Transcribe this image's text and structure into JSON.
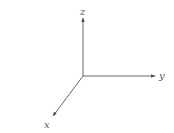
{
  "diagram": {
    "title": "",
    "type": "3d-coordinate-axes",
    "colors": {
      "line": "#555555",
      "background": "#ffffff"
    },
    "origin": {
      "x": 83,
      "y": 76
    },
    "axes": [
      {
        "name": "z",
        "label": "z",
        "direction": "up"
      },
      {
        "name": "y",
        "label": "y",
        "direction": "right"
      },
      {
        "name": "x",
        "label": "x",
        "direction": "down-left"
      }
    ]
  }
}
